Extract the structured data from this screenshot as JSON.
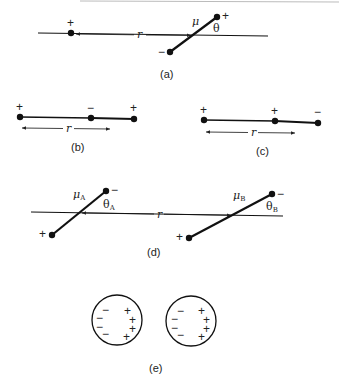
{
  "figure": {
    "panels": [
      {
        "id": "a",
        "caption": "(a)",
        "charge_sign": "+",
        "dipole_label": "μ",
        "angle_label": "θ",
        "distance_label": "r",
        "dipole_pos_sign": "+",
        "dipole_neg_sign": "−"
      },
      {
        "id": "b",
        "caption": "(b)",
        "signs": [
          "+",
          "−",
          "+"
        ],
        "distance_label": "r"
      },
      {
        "id": "c",
        "caption": "(c)",
        "signs": [
          "+",
          "+",
          "−"
        ],
        "distance_label": "r"
      },
      {
        "id": "d",
        "caption": "(d)",
        "dipole_a_label": "μ",
        "dipole_a_sub": "A",
        "angle_a_label": "θ",
        "angle_a_sub": "A",
        "dipole_b_label": "μ",
        "dipole_b_sub": "B",
        "angle_b_label": "θ",
        "angle_b_sub": "B",
        "distance_label": "r",
        "a_neg_sign": "−",
        "a_pos_sign": "+",
        "b_neg_sign": "−",
        "b_pos_sign": "+"
      },
      {
        "id": "e",
        "caption": "(e)",
        "sphere_1_neg": [
          "−",
          "−",
          "−",
          "−"
        ],
        "sphere_1_pos": [
          "+",
          "+",
          "+",
          "+"
        ],
        "sphere_2_neg": [
          "−",
          "−",
          "−",
          "−"
        ],
        "sphere_2_pos": [
          "+",
          "+",
          "+",
          "+"
        ]
      }
    ],
    "colors": {
      "ink": "#111111",
      "background": "#ffffff"
    }
  }
}
